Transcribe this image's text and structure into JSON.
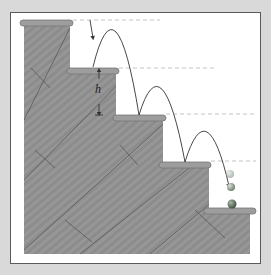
{
  "diagram": {
    "title": "",
    "labels": {
      "step_height": "h"
    },
    "colors": {
      "background": "#d9d9d9",
      "panel": "#ffffff",
      "wood": "#8f8f8f",
      "wood_dark": "#6e6e6e",
      "tread": "#9a9a9a",
      "trajectory": "#333333",
      "dashed_line": "#bbbbbb",
      "ball": "#8a9a8a"
    },
    "steps": [
      {
        "index": 1,
        "tread_y": 20
      },
      {
        "index": 2,
        "tread_y": 68
      },
      {
        "index": 3,
        "tread_y": 115
      },
      {
        "index": 4,
        "tread_y": 162
      },
      {
        "index": 5,
        "tread_y": 208
      }
    ],
    "bounces": 3,
    "balls_shown": 3
  }
}
